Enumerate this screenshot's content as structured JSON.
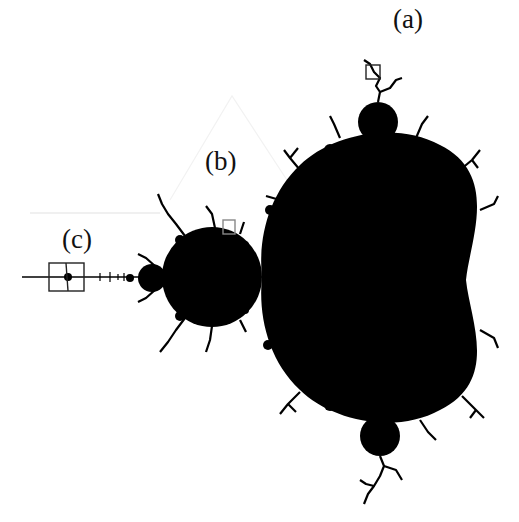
{
  "figure": {
    "background_color": "#ffffff",
    "set_color": "#000000",
    "box_color": "#222222",
    "labels": [
      {
        "id": "a",
        "text": "(a)",
        "x": 393,
        "y": 6
      },
      {
        "id": "b",
        "text": "(b)",
        "x": 205,
        "y": 148
      },
      {
        "id": "c",
        "text": "(c)",
        "x": 62,
        "y": 226
      }
    ],
    "zoom_boxes": [
      {
        "id": "a",
        "x": 366,
        "y": 65,
        "w": 14,
        "h": 14
      },
      {
        "id": "b",
        "x": 223,
        "y": 220,
        "w": 12,
        "h": 14
      },
      {
        "id": "c",
        "x": 49,
        "y": 263,
        "w": 35,
        "h": 28
      }
    ]
  }
}
